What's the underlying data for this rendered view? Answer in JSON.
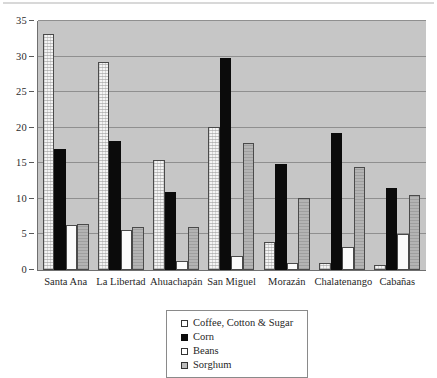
{
  "chart_data": {
    "type": "bar",
    "title": "",
    "xlabel": "",
    "ylabel": "",
    "ylim": [
      0,
      35
    ],
    "ytick_step": 5,
    "yticks": [
      "0",
      "5",
      "10",
      "15",
      "20",
      "25",
      "30",
      "35"
    ],
    "grid": true,
    "legend_position": "bottom-center",
    "categories": [
      "Santa Ana",
      "La Libertad",
      "Ahuachapán",
      "San Miguel",
      "Morazán",
      "Chalatenango",
      "Cabañas"
    ],
    "series": [
      {
        "name": "Coffee, Cotton & Sugar",
        "color": "#f4f4f4",
        "values": [
          33.2,
          29.3,
          15.5,
          20.1,
          3.9,
          1.0,
          0.7
        ]
      },
      {
        "name": "Corn",
        "color": "#0b0b0b",
        "values": [
          17.0,
          18.1,
          11.0,
          29.8,
          14.9,
          19.3,
          11.5
        ]
      },
      {
        "name": "Beans",
        "color": "#fbfbfb",
        "values": [
          6.3,
          5.6,
          1.2,
          1.9,
          1.0,
          3.2,
          5.0
        ]
      },
      {
        "name": "Sorghum",
        "color": "#b4b4b4",
        "values": [
          6.5,
          6.0,
          6.0,
          17.8,
          10.1,
          14.5,
          10.5
        ]
      }
    ]
  },
  "legend": {
    "items": [
      {
        "label": "Coffee, Cotton & Sugar"
      },
      {
        "label": "Corn"
      },
      {
        "label": "Beans"
      },
      {
        "label": "Sorghum"
      }
    ]
  }
}
